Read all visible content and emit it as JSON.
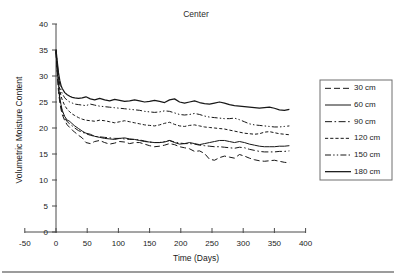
{
  "chart_data": {
    "type": "line",
    "title": "Center",
    "xlabel": "Time (Days)",
    "ylabel": "Volumetric Moisture Content",
    "xlim": [
      -50,
      400
    ],
    "ylim": [
      0,
      40
    ],
    "xticks": [
      -50,
      0,
      50,
      100,
      150,
      200,
      250,
      300,
      350,
      400
    ],
    "yticks": [
      0,
      5,
      10,
      15,
      20,
      25,
      30,
      35,
      40
    ],
    "xtick_labels": [
      "-50",
      "0",
      "50",
      "100",
      "150",
      "200",
      "250",
      "300",
      "350",
      "400"
    ],
    "ytick_labels": [
      "0",
      "5",
      "10",
      "15",
      "20",
      "25",
      "30",
      "35",
      "40"
    ],
    "grid": false,
    "legend_position": "right",
    "x": [
      0,
      2,
      4,
      6,
      8,
      10,
      14,
      18,
      22,
      26,
      30,
      36,
      42,
      48,
      55,
      62,
      70,
      78,
      86,
      94,
      102,
      110,
      118,
      126,
      134,
      142,
      150,
      158,
      166,
      174,
      182,
      190,
      198,
      206,
      214,
      222,
      230,
      238,
      246,
      254,
      262,
      270,
      278,
      286,
      294,
      302,
      310,
      318,
      326,
      334,
      342,
      350,
      358,
      366,
      374
    ],
    "series": [
      {
        "name": "30 cm",
        "dash": "dashed",
        "values": [
          34.6,
          30.5,
          27.0,
          25.0,
          23.6,
          22.6,
          21.4,
          20.6,
          20.1,
          19.6,
          19.2,
          18.6,
          18.1,
          17.2,
          17.0,
          17.4,
          17.6,
          17.2,
          16.9,
          17.1,
          17.4,
          17.3,
          17.0,
          17.2,
          17.2,
          16.9,
          16.6,
          16.4,
          16.5,
          16.7,
          17.0,
          16.8,
          16.4,
          16.2,
          16.0,
          15.5,
          15.6,
          15.1,
          14.0,
          13.8,
          14.3,
          14.6,
          14.4,
          14.2,
          14.9,
          14.6,
          14.2,
          13.9,
          13.7,
          13.6,
          13.7,
          13.8,
          13.6,
          13.4,
          13.3
        ]
      },
      {
        "name": "60 cm",
        "dash": "solid",
        "values": [
          34.8,
          31.2,
          28.2,
          26.0,
          24.5,
          23.4,
          22.2,
          21.5,
          21.3,
          20.8,
          20.4,
          19.9,
          19.4,
          19.0,
          18.8,
          18.4,
          18.2,
          18.0,
          17.9,
          17.8,
          18.0,
          18.1,
          17.9,
          17.8,
          17.6,
          17.4,
          17.3,
          17.2,
          17.2,
          17.3,
          17.6,
          17.2,
          16.9,
          17.0,
          17.2,
          17.0,
          16.8,
          17.0,
          17.2,
          17.4,
          17.6,
          17.6,
          17.4,
          17.2,
          17.4,
          17.2,
          16.9,
          16.7,
          16.5,
          16.4,
          16.4,
          16.4,
          16.5,
          16.5,
          16.6
        ]
      },
      {
        "name": "90 cm",
        "dash": "dashdot",
        "values": [
          34.7,
          30.9,
          27.8,
          25.6,
          24.2,
          23.1,
          21.9,
          21.2,
          20.8,
          20.4,
          20.0,
          19.5,
          19.2,
          18.9,
          18.6,
          18.4,
          18.3,
          18.2,
          18.1,
          18.0,
          18.0,
          17.9,
          17.8,
          17.8,
          17.7,
          17.5,
          17.3,
          17.2,
          17.2,
          17.4,
          17.6,
          17.3,
          17.1,
          17.0,
          17.0,
          16.9,
          16.7,
          16.6,
          16.5,
          16.4,
          16.4,
          16.3,
          16.2,
          16.1,
          16.3,
          16.2,
          15.9,
          15.7,
          15.5,
          15.4,
          15.4,
          15.4,
          15.5,
          15.5,
          15.6
        ]
      },
      {
        "name": "120 cm",
        "dash": "finedash",
        "values": [
          34.9,
          31.8,
          29.2,
          27.4,
          26.2,
          25.4,
          24.3,
          23.6,
          23.1,
          22.7,
          22.4,
          22.0,
          21.7,
          21.5,
          21.4,
          21.3,
          21.5,
          21.4,
          21.2,
          21.0,
          21.2,
          21.4,
          21.2,
          21.0,
          20.8,
          20.6,
          20.5,
          20.4,
          20.6,
          20.9,
          21.1,
          20.7,
          20.4,
          20.3,
          20.5,
          20.6,
          20.4,
          20.2,
          20.1,
          20.0,
          19.9,
          19.8,
          19.6,
          19.4,
          19.2,
          19.0,
          18.9,
          18.8,
          18.9,
          19.2,
          19.3,
          19.1,
          18.9,
          18.8,
          18.7
        ]
      },
      {
        "name": "150 cm",
        "dash": "dashdotdot",
        "values": [
          35.0,
          32.4,
          30.0,
          28.4,
          27.3,
          26.6,
          25.8,
          25.3,
          25.0,
          24.8,
          24.6,
          24.5,
          24.4,
          24.3,
          24.6,
          24.4,
          24.2,
          24.1,
          24.0,
          23.9,
          23.8,
          23.7,
          23.6,
          23.5,
          23.4,
          23.2,
          23.1,
          23.0,
          23.1,
          23.3,
          23.2,
          22.9,
          22.6,
          22.5,
          22.6,
          22.8,
          22.6,
          22.3,
          22.1,
          22.0,
          21.9,
          21.8,
          21.8,
          21.9,
          21.6,
          21.2,
          20.8,
          20.6,
          20.5,
          20.4,
          20.3,
          20.2,
          20.2,
          20.3,
          20.4
        ]
      },
      {
        "name": "180 cm",
        "dash": "solid",
        "values": [
          35.1,
          32.8,
          30.6,
          29.2,
          28.2,
          27.6,
          26.8,
          26.4,
          26.1,
          25.9,
          25.8,
          25.7,
          25.8,
          26.0,
          25.6,
          25.4,
          25.7,
          25.4,
          25.2,
          25.5,
          25.3,
          25.1,
          25.2,
          25.4,
          25.2,
          25.0,
          25.1,
          25.3,
          25.1,
          24.9,
          25.4,
          25.6,
          25.0,
          24.8,
          25.0,
          25.2,
          24.9,
          24.7,
          24.6,
          24.8,
          25.0,
          24.8,
          24.5,
          24.3,
          24.2,
          24.1,
          24.0,
          23.9,
          23.8,
          23.9,
          24.0,
          23.8,
          23.5,
          23.4,
          23.6
        ]
      }
    ]
  },
  "legend": {
    "items": [
      {
        "label": "30 cm"
      },
      {
        "label": "60 cm"
      },
      {
        "label": "90 cm"
      },
      {
        "label": "120 cm"
      },
      {
        "label": "150 cm"
      },
      {
        "label": "180 cm"
      }
    ]
  }
}
